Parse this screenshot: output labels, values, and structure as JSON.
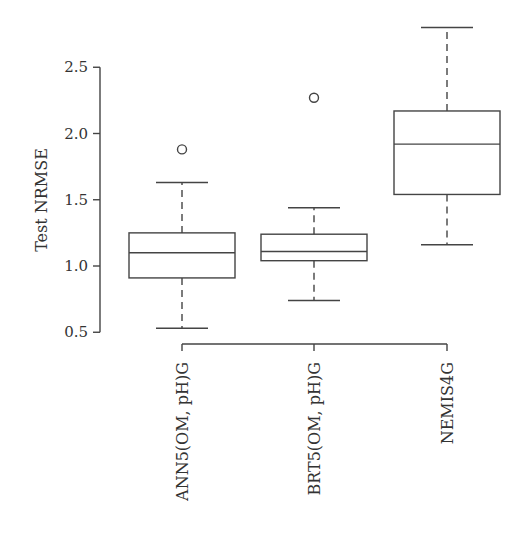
{
  "chart_data": {
    "type": "boxplot",
    "title": "",
    "xlabel": "",
    "ylabel": "Test NRMSE",
    "ylim": [
      0.5,
      2.8
    ],
    "yticks": [
      0.5,
      1.0,
      1.5,
      2.0,
      2.5
    ],
    "ytick_labels": [
      "0.5",
      "1.0",
      "1.5",
      "2.0",
      "2.5"
    ],
    "grid": false,
    "categories": [
      "ANN5(OM, pH)G",
      "BRT5(OM, pH)G",
      "NEMIS4G"
    ],
    "series": [
      {
        "name": "ANN5(OM, pH)G",
        "whisker_low": 0.53,
        "q1": 0.91,
        "median": 1.1,
        "q3": 1.25,
        "whisker_high": 1.63,
        "outliers": [
          1.88
        ]
      },
      {
        "name": "BRT5(OM, pH)G",
        "whisker_low": 0.74,
        "q1": 1.04,
        "median": 1.11,
        "q3": 1.24,
        "whisker_high": 1.44,
        "outliers": [
          2.27
        ]
      },
      {
        "name": "NEMIS4G",
        "whisker_low": 1.16,
        "q1": 1.54,
        "median": 1.92,
        "q3": 2.17,
        "whisker_high": 2.8,
        "outliers": []
      }
    ],
    "colors": {
      "stroke": "#444444",
      "text": "#333333",
      "background": "#ffffff"
    }
  }
}
